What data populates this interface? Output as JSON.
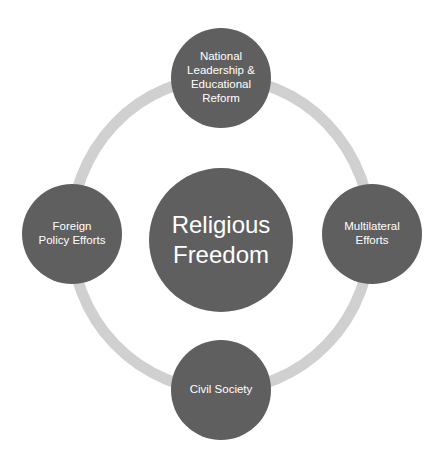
{
  "diagram": {
    "title": "Religious Freedom",
    "center": {
      "label": "Religious\nFreedom"
    },
    "nodes": [
      {
        "id": "top",
        "label": "National\nLeadership &\nEducational\nReform"
      },
      {
        "id": "right",
        "label": "Multilateral\nEfforts"
      },
      {
        "id": "bottom",
        "label": "Civil Society"
      },
      {
        "id": "left",
        "label": "Foreign\nPolicy Efforts"
      }
    ],
    "colors": {
      "node_fill": "#5f5f5f",
      "ring": "#d0d0d0",
      "text": "#ffffff",
      "background": "#ffffff"
    }
  }
}
